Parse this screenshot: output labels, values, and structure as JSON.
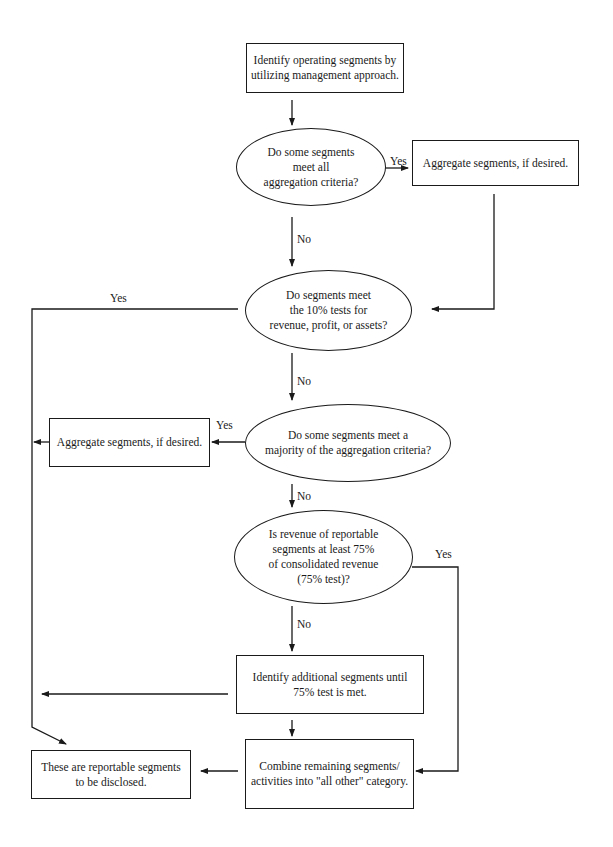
{
  "diagram": {
    "type": "flowchart",
    "nodes": {
      "start": "Identify operating segments by\nutilizing management approach.",
      "q_all_criteria": "Do some segments\nmeet all\naggregation criteria?",
      "aggregate_1": "Aggregate segments, if desired.",
      "q_ten_percent": "Do segments meet\nthe 10% tests for\nrevenue, profit, or assets?",
      "q_majority": "Do some segments meet a\nmajority of the aggregation criteria?",
      "aggregate_2": "Aggregate segments, if desired.",
      "q_75_test": "Is revenue of reportable\nsegments at least 75%\nof consolidated revenue\n(75% test)?",
      "identify_additional": "Identify additional segments until\n75% test is met.",
      "combine_remaining": "Combine remaining segments/\nactivities into \"all other\" category.",
      "reportable": "These are reportable segments\nto be disclosed."
    },
    "edge_labels": {
      "all_criteria_yes": "Yes",
      "all_criteria_no": "No",
      "ten_percent_yes": "Yes",
      "ten_percent_no": "No",
      "majority_yes": "Yes",
      "majority_no": "No",
      "test75_yes": "Yes",
      "test75_no": "No"
    },
    "line_color": "#1a1a1a"
  }
}
